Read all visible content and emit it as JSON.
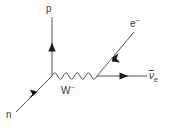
{
  "diagram": {
    "name": "beta-minus-decay-feynman-diagram",
    "type": "feynman-diagram",
    "background_color": "#ffffff",
    "line_color": "#555555",
    "text_color": "#3a3a3a",
    "width": 175,
    "height": 128,
    "labels": {
      "proton": "p",
      "neutron": "n",
      "w_boson_symbol": "W",
      "w_boson_charge": "−",
      "electron_symbol": "e",
      "electron_charge": "−",
      "antineutrino_symbol": "ν",
      "antineutrino_subscript": "e"
    },
    "vertices": [
      {
        "name": "hadronic-vertex",
        "x": 52,
        "y": 76
      },
      {
        "name": "leptonic-vertex",
        "x": 97,
        "y": 76
      }
    ],
    "lines": [
      {
        "name": "neutron-line",
        "particle": "n",
        "style": "fermion",
        "from": {
          "x": 16,
          "y": 112
        },
        "to": {
          "x": 52,
          "y": 76
        },
        "arrow_direction": "toward-vertex",
        "arrow_at": {
          "x": 33,
          "y": 95
        }
      },
      {
        "name": "proton-line",
        "particle": "p",
        "style": "fermion",
        "from": {
          "x": 52,
          "y": 76
        },
        "to": {
          "x": 52,
          "y": 17
        },
        "arrow_direction": "away-from-vertex",
        "arrow_at": {
          "x": 52,
          "y": 47
        }
      },
      {
        "name": "w-boson-line",
        "particle": "W",
        "style": "wavy",
        "from": {
          "x": 52,
          "y": 76
        },
        "to": {
          "x": 97,
          "y": 76
        }
      },
      {
        "name": "electron-line",
        "particle": "e",
        "style": "fermion",
        "from": {
          "x": 97,
          "y": 76
        },
        "to": {
          "x": 134,
          "y": 32
        },
        "arrow_direction": "toward-vertex",
        "arrow_at": {
          "x": 115,
          "y": 54
        }
      },
      {
        "name": "antineutrino-line",
        "particle": "nu-e-bar",
        "style": "fermion",
        "from": {
          "x": 97,
          "y": 76
        },
        "to": {
          "x": 147,
          "y": 76
        },
        "arrow_direction": "away-from-vertex",
        "arrow_at": {
          "x": 124,
          "y": 76
        }
      }
    ]
  }
}
